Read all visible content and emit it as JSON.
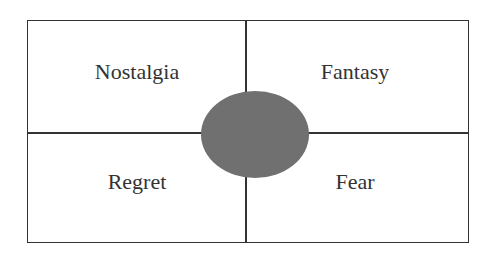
{
  "diagram": {
    "quadrants": [
      {
        "label": "Nostalgia",
        "position": "top-left"
      },
      {
        "label": "Fantasy",
        "position": "top-right"
      },
      {
        "label": "Regret",
        "position": "bottom-left"
      },
      {
        "label": "Fear",
        "position": "bottom-right"
      }
    ],
    "center_shape": {
      "type": "ellipse",
      "color": "#707070"
    },
    "line_color": "#333333"
  }
}
